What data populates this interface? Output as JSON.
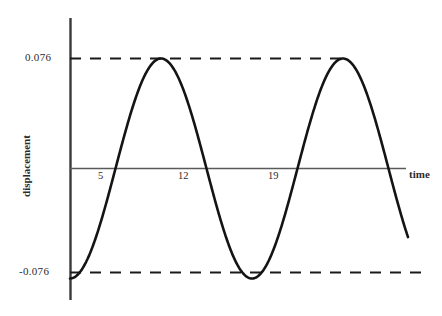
{
  "chart_data": {
    "type": "line",
    "title": "",
    "xlabel": "time",
    "ylabel": "displacement",
    "amplitude": 0.076,
    "period": 14,
    "phase": "starts at minimum (negative cosine)",
    "equation_form": "y = -0.076 * cos(2*pi*(t)/14)",
    "xlim": [
      0,
      24
    ],
    "ylim": [
      -0.1,
      0.1
    ],
    "grid": false,
    "legend": null,
    "x_ticks": [
      5,
      12,
      19
    ],
    "x_tick_labels": [
      "5",
      "12",
      "19"
    ],
    "y_ticks": [
      0.076,
      -0.076
    ],
    "y_tick_labels": [
      "0.076",
      "-0.076"
    ],
    "reference_lines": [
      {
        "name": "upper-bound",
        "value": 0.076,
        "style": "dashed"
      },
      {
        "name": "lower-bound",
        "value": -0.076,
        "style": "dashed"
      }
    ],
    "key_points": [
      {
        "t": 0,
        "y": -0.076,
        "kind": "minimum"
      },
      {
        "t": 5,
        "y": 0,
        "kind": "zero-crossing-rising"
      },
      {
        "t": 8.5,
        "y": 0.076,
        "kind": "maximum"
      },
      {
        "t": 12,
        "y": 0,
        "kind": "zero-crossing-falling"
      },
      {
        "t": 15.5,
        "y": -0.076,
        "kind": "minimum"
      },
      {
        "t": 19,
        "y": 0,
        "kind": "zero-crossing-rising"
      },
      {
        "t": 22.5,
        "y": 0.076,
        "kind": "maximum"
      },
      {
        "t": 26,
        "y": -0.076,
        "kind": "minimum"
      }
    ],
    "series": [
      {
        "name": "displacement",
        "color": "#1a1a1a",
        "values": [
          -0.076,
          -0.0745,
          -0.07,
          -0.0627,
          -0.0529,
          -0.0408,
          -0.027,
          -0.012,
          0.0034,
          0.0186,
          0.033,
          0.046,
          0.057,
          0.0656,
          0.0715,
          0.075,
          0.076,
          0.0745,
          0.07,
          0.0627,
          0.0529,
          0.0408,
          0.027,
          0.012,
          -0.0034,
          -0.0186,
          -0.033,
          -0.046,
          -0.057,
          -0.0656,
          -0.0715,
          -0.075,
          -0.076
        ]
      }
    ]
  },
  "labels": {
    "y_max": "0.076",
    "y_min": "-0.076",
    "tick_5": "5",
    "tick_12": "12",
    "tick_19": "19",
    "axis_time": "time",
    "axis_displacement": "displacement"
  },
  "colors": {
    "background": "#ffffff",
    "curve": "#1a1a1a",
    "axis": "#4a4a4a",
    "dashed": "#1a1a1a",
    "text": "#2b2b2b"
  }
}
